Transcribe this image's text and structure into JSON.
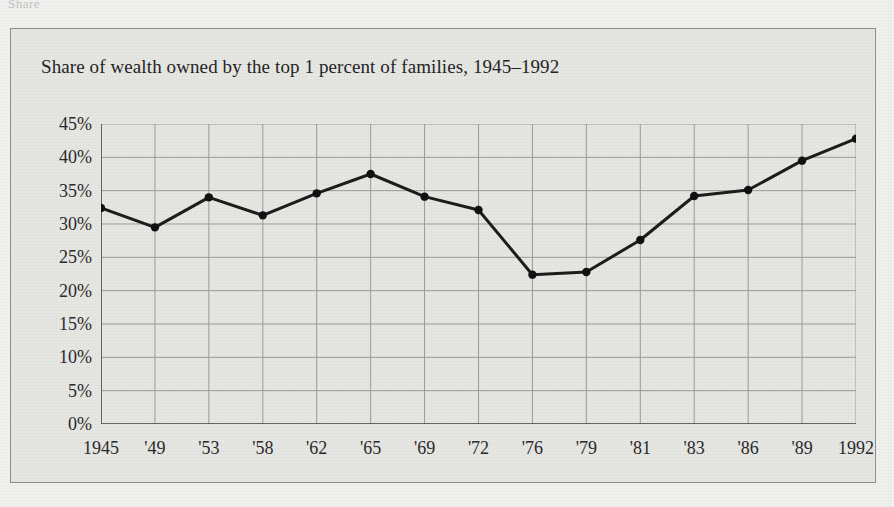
{
  "page": {
    "top_cut_text": "Share"
  },
  "figure": {
    "title": "Share of wealth owned by the top 1 percent of families, 1945–1992"
  },
  "colors": {
    "page_background": "#f1f1ef",
    "figure_background": "#e6e6e3",
    "border": "#8d8d8b",
    "gridline": "#9a9a98",
    "axis": "#4a4a4a",
    "series_line": "#1c1c1c",
    "marker": "#111111",
    "text": "#242424"
  },
  "chart_data": {
    "type": "line",
    "title": "Share of wealth owned by the top 1 percent of families, 1945–1992",
    "xlabel": "",
    "ylabel": "",
    "categories": [
      "1945",
      "'49",
      "'53",
      "'58",
      "'62",
      "'65",
      "'69",
      "'72",
      "'76",
      "'79",
      "'81",
      "'83",
      "'86",
      "'89",
      "1992"
    ],
    "values": [
      32.4,
      29.5,
      34.0,
      31.3,
      34.6,
      37.5,
      34.1,
      32.1,
      22.4,
      22.8,
      27.6,
      34.2,
      35.1,
      39.5,
      42.8
    ],
    "ylim": [
      0,
      45
    ],
    "ytick_values": [
      0,
      5,
      10,
      15,
      20,
      25,
      30,
      35,
      40,
      45
    ],
    "ytick_labels": [
      "0%",
      "5%",
      "10%",
      "15%",
      "20%",
      "25%",
      "30%",
      "35%",
      "40%",
      "45%"
    ],
    "grid": true,
    "legend": "none",
    "marker": "filled-circle",
    "series_name": "Share of wealth owned by top 1 percent"
  }
}
